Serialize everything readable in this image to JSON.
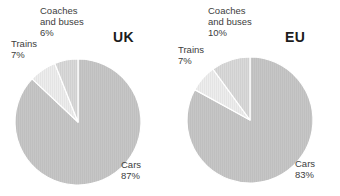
{
  "chart_data": [
    {
      "type": "pie",
      "title": "UK",
      "categories": [
        "Cars",
        "Coaches and buses",
        "Trains"
      ],
      "values": [
        87,
        6,
        7
      ],
      "labels": [
        {
          "name": "Cars",
          "pct": "87%"
        },
        {
          "name": "Coaches and buses",
          "pct": "6%"
        },
        {
          "name": "Trains",
          "pct": "7%"
        }
      ],
      "unit": "%",
      "legend": "none",
      "grid": false,
      "colors": [
        "#c4c4c4",
        "#d6d6d6",
        "#ececec"
      ],
      "start_angle_deg": 0,
      "direction": "clockwise"
    },
    {
      "type": "pie",
      "title": "EU",
      "categories": [
        "Cars",
        "Coaches and buses",
        "Trains"
      ],
      "values": [
        83,
        10,
        7
      ],
      "labels": [
        {
          "name": "Cars",
          "pct": "83%"
        },
        {
          "name": "Coaches and buses",
          "pct": "10%"
        },
        {
          "name": "Trains",
          "pct": "7%"
        }
      ],
      "unit": "%",
      "legend": "none",
      "grid": false,
      "colors": [
        "#c4c4c4",
        "#d6d6d6",
        "#ececec"
      ],
      "start_angle_deg": 0,
      "direction": "clockwise"
    }
  ],
  "uk": {
    "title": "UK",
    "coaches_name_line1": "Coaches",
    "coaches_name_line2": "and buses",
    "coaches_pct": "6%",
    "trains_name": "Trains",
    "trains_pct": "7%",
    "cars_name": "Cars",
    "cars_pct": "87%"
  },
  "eu": {
    "title": "EU",
    "coaches_name_line1": "Coaches",
    "coaches_name_line2": "and buses",
    "coaches_pct": "10%",
    "trains_name": "Trains",
    "trains_pct": "7%",
    "cars_name": "Cars",
    "cars_pct": "83%"
  }
}
